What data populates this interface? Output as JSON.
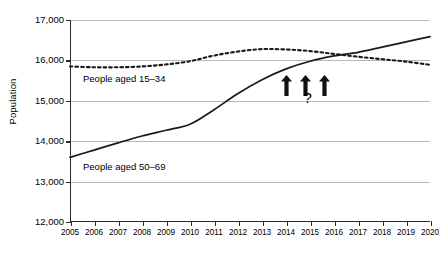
{
  "chart_data": {
    "type": "line",
    "title": "",
    "xlabel": "",
    "ylabel": "Population",
    "xlim": [
      2005,
      2020
    ],
    "ylim": [
      12000,
      17000
    ],
    "grid": true,
    "legend_position": "inline-annotation",
    "x": [
      2005,
      2006,
      2007,
      2008,
      2009,
      2010,
      2011,
      2012,
      2013,
      2014,
      2015,
      2016,
      2017,
      2018,
      2019,
      2020
    ],
    "xtick_labels": [
      "2005",
      "2006",
      "2007",
      "2008",
      "2009",
      "2010",
      "2011",
      "2012",
      "2013",
      "2014",
      "2015",
      "2016",
      "2017",
      "2018",
      "2019",
      "2020"
    ],
    "ytick_labels": [
      "17,000",
      "16,000",
      "15,000",
      "14,000",
      "13,000",
      "12,000"
    ],
    "ytick_values": [
      17000,
      16000,
      15000,
      14000,
      13000,
      12000
    ],
    "series": [
      {
        "name": "People aged 15–34",
        "style": "dotted",
        "color": "#1a1a1a",
        "values": [
          15850,
          15830,
          15830,
          15850,
          15900,
          15980,
          16120,
          16220,
          16280,
          16270,
          16230,
          16160,
          16090,
          16030,
          15970,
          15890
        ]
      },
      {
        "name": "People aged 50–69",
        "style": "solid",
        "color": "#1a1a1a",
        "values": [
          13600,
          13780,
          13960,
          14130,
          14270,
          14420,
          14780,
          15180,
          15520,
          15790,
          15980,
          16110,
          16200,
          16330,
          16460,
          16590
        ]
      }
    ],
    "annotations": {
      "arrows": [
        {
          "name": "up-arrow-1",
          "x_year": 2014,
          "y_value": 15380
        },
        {
          "name": "up-arrow-2",
          "x_year": 2014.8,
          "y_value": 15380
        },
        {
          "name": "up-arrow-3",
          "x_year": 2015.6,
          "y_value": 15380
        }
      ],
      "question_mark": {
        "text": "?",
        "x_year": 2014.9,
        "y_value": 15060
      }
    }
  },
  "series_labels": {
    "young": "People aged 15–34",
    "old": "People aged 50–69"
  },
  "axis": {
    "y_title": "Population"
  },
  "colors": {
    "line": "#1a1a1a",
    "grid": "#b8b8b8",
    "axis": "#2b2b2b",
    "background": "#ffffff"
  }
}
